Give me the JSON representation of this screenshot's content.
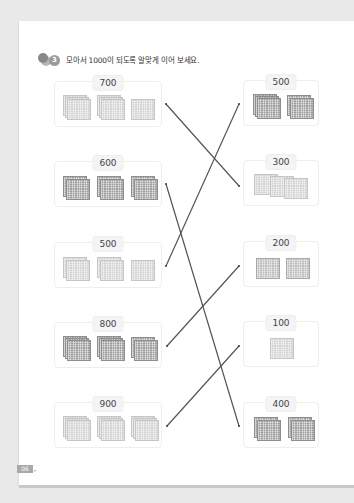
{
  "instruction": {
    "number": "3",
    "text": "모아서 1000이 되도록 알맞게 이어 보세요."
  },
  "left_cards": [
    {
      "label": "700",
      "blocks": [
        3,
        3,
        1
      ],
      "tone": "light"
    },
    {
      "label": "600",
      "blocks": [
        2,
        2,
        2
      ],
      "tone": "dark"
    },
    {
      "label": "500",
      "blocks": [
        2,
        2,
        1
      ],
      "tone": "light"
    },
    {
      "label": "800",
      "blocks": [
        3,
        3,
        2
      ],
      "tone": "dark"
    },
    {
      "label": "900",
      "blocks": [
        3,
        3,
        3
      ],
      "tone": "light"
    }
  ],
  "right_cards": [
    {
      "label": "500",
      "blocks": [
        3,
        2
      ],
      "tone": "dark"
    },
    {
      "label": "300",
      "blocks": [
        3
      ],
      "tone": "light"
    },
    {
      "label": "200",
      "blocks": [
        1,
        1
      ],
      "tone": "mid"
    },
    {
      "label": "100",
      "blocks": [
        1
      ],
      "tone": "light"
    },
    {
      "label": "400",
      "blocks": [
        2,
        2
      ],
      "tone": "dark"
    }
  ],
  "connections": [
    {
      "from": "700",
      "to": "300"
    },
    {
      "from": "600",
      "to": "400"
    },
    {
      "from": "500",
      "to": "500"
    },
    {
      "from": "800",
      "to": "200"
    },
    {
      "from": "900",
      "to": "100"
    }
  ],
  "footer": {
    "page_number": "06"
  }
}
